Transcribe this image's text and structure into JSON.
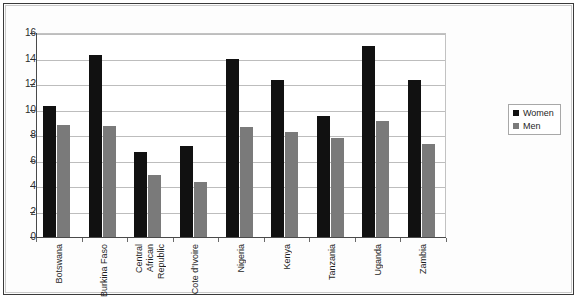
{
  "chart_data": {
    "type": "bar",
    "title": "",
    "subtitle": "",
    "xlabel": "",
    "ylabel": "",
    "ylim": [
      0,
      16
    ],
    "ytick_step": 2,
    "yticks": [
      "16",
      "14",
      "12",
      "10",
      "8",
      "6",
      "4",
      "2",
      "0"
    ],
    "grid": true,
    "legend_position": "right",
    "categories": [
      "Botswana",
      "Burkina Faso",
      "Central African Republic",
      "Cote d'Ivoire",
      "Nigeria",
      "Kenya",
      "Tanzania",
      "Uganda",
      "Zambia"
    ],
    "category_lines": [
      [
        "Botswana"
      ],
      [
        "Burkina Faso"
      ],
      [
        "Central",
        "African",
        "Republic"
      ],
      [
        "Cote d'Ivoire"
      ],
      [
        "Nigeria"
      ],
      [
        "Kenya"
      ],
      [
        "Tanzania"
      ],
      [
        "Uganda"
      ],
      [
        "Zambia"
      ]
    ],
    "series": [
      {
        "name": "Women",
        "color": "#111111",
        "values": [
          10.3,
          14.3,
          6.7,
          7.1,
          14.0,
          12.3,
          9.5,
          15.0,
          12.3
        ]
      },
      {
        "name": "Men",
        "color": "#7a7a7a",
        "values": [
          8.8,
          8.7,
          4.9,
          4.3,
          8.6,
          8.2,
          7.8,
          9.1,
          7.3
        ]
      }
    ]
  },
  "legend": {
    "items": [
      {
        "label": "Women",
        "color": "#111111"
      },
      {
        "label": "Men",
        "color": "#7a7a7a"
      }
    ]
  }
}
